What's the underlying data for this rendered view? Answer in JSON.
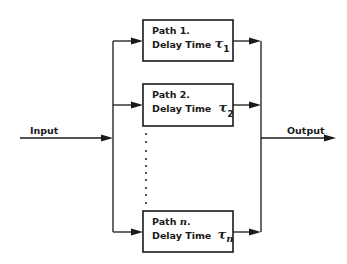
{
  "diagram": {
    "title": "",
    "input_label": "Input",
    "output_label": "Output",
    "delay_symbol": "τ",
    "paths": [
      {
        "name": "Path 1.",
        "name_prefix": "Path ",
        "index": "1",
        "suffix": ".",
        "delay_text": "Delay Time ",
        "delay_sub": "1"
      },
      {
        "name": "Path 2.",
        "name_prefix": "Path ",
        "index": "2",
        "suffix": ".",
        "delay_text": "Delay Time ",
        "delay_sub": "2"
      },
      {
        "name": "Path n.",
        "name_prefix": "Path ",
        "index": "n",
        "suffix": ".",
        "delay_text": "Delay Time ",
        "delay_sub": "n"
      }
    ],
    "ellipsis": "vertical dots indicating paths 3 through n-1",
    "colors": {
      "stroke": "#1a1a1a",
      "background": "#ffffff"
    }
  }
}
